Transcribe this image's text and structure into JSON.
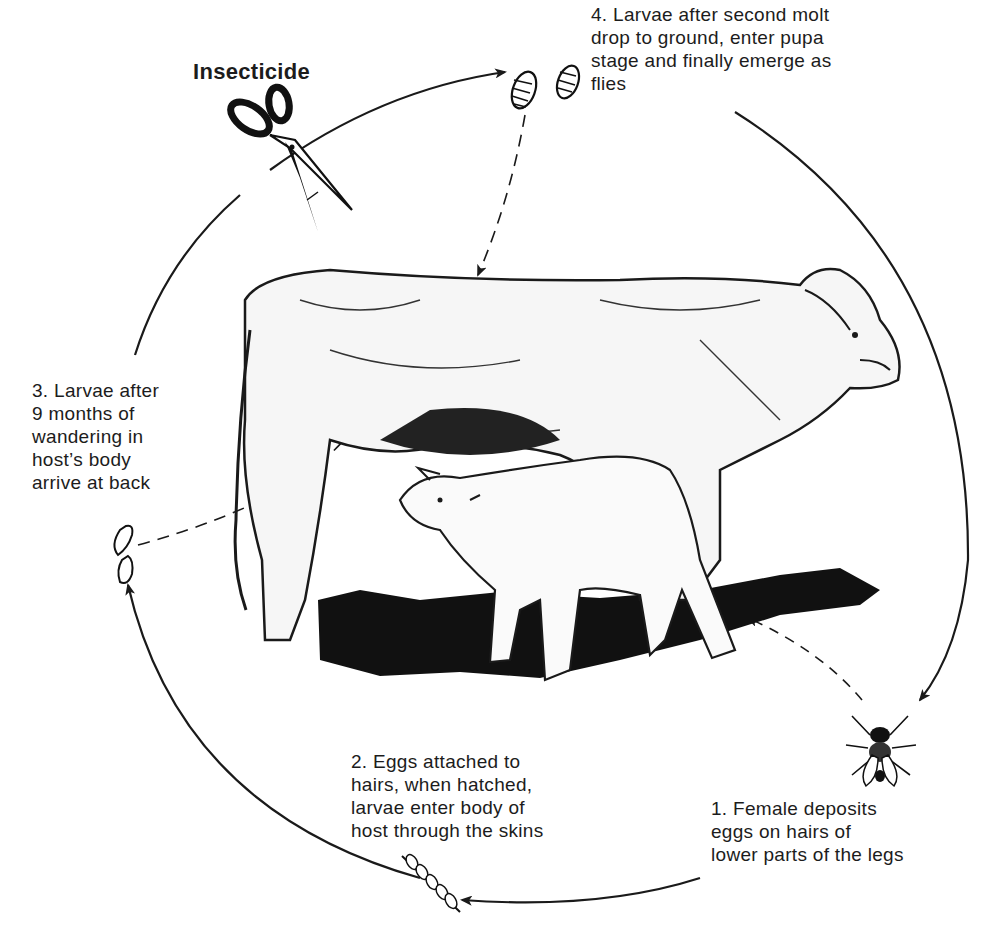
{
  "diagram": {
    "type": "life-cycle",
    "colors": {
      "ink": "#1a1a1a",
      "background": "#ffffff"
    },
    "control_label": "Insecticide",
    "stages": [
      {
        "id": 1,
        "text": "1. Female deposits\neggs on hairs of\nlower parts of the legs",
        "icon": "fly-icon"
      },
      {
        "id": 2,
        "text": "2. Eggs attached to\nhairs, when hatched,\nlarvae enter body of\nhost through the skins",
        "icon": "eggs-on-hair-icon"
      },
      {
        "id": 3,
        "text": "3. Larvae after\n9 months  of\nwandering in\nhost’s  body\narrive at back",
        "icon": "larva-icon"
      },
      {
        "id": 4,
        "text": "4. Larvae after second molt\ndrop to ground, enter pupa\nstage and finally emerge as\nflies",
        "icon": "grub-icon"
      }
    ],
    "illustration": "cow-with-nursing-calf",
    "control_icon": "scissors-icon"
  }
}
